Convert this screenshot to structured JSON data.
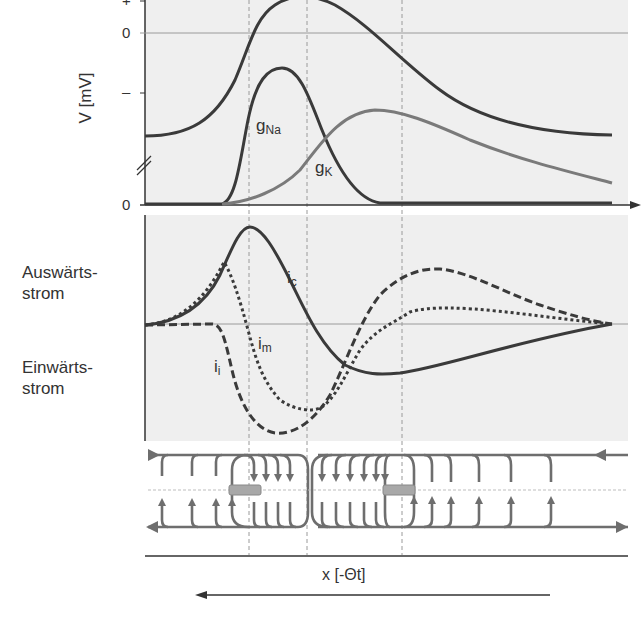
{
  "figure": {
    "top_panel": {
      "y_axis_label": "V [mV]",
      "y_ticks": [
        "+",
        "0",
        "–",
        "0"
      ],
      "curves": [
        {
          "id": "V",
          "label": "",
          "style": "solid",
          "color": "#3a3a3a"
        },
        {
          "id": "gNa",
          "label": "g",
          "sub": "Na",
          "style": "solid",
          "color": "#3a3a3a"
        },
        {
          "id": "gK",
          "label": "g",
          "sub": "K",
          "style": "solid",
          "color": "#7a7a7a"
        }
      ]
    },
    "middle_panel": {
      "label_outward": [
        "Auswärts-",
        "strom"
      ],
      "label_inward": [
        "Einwärts-",
        "strom"
      ],
      "curves": [
        {
          "id": "ic",
          "label": "i",
          "sub": "c",
          "style": "solid"
        },
        {
          "id": "im",
          "label": "i",
          "sub": "m",
          "style": "dotted"
        },
        {
          "id": "ii",
          "label": "i",
          "sub": "i",
          "style": "dashed"
        }
      ]
    },
    "bottom_panel": {
      "description": "Local circuit current field lines along axon",
      "x_axis_label": "x [-Θt]",
      "direction_arrow": "left"
    },
    "colors": {
      "panel_bg": "#eeeeee",
      "dark_line": "#3a3a3a",
      "gray_line": "#7a7a7a",
      "field_line": "#6e6e6e",
      "guide_dash": "#9a9a9a"
    }
  }
}
